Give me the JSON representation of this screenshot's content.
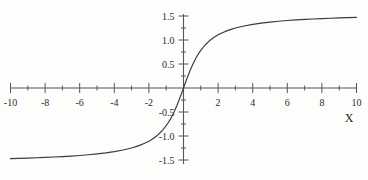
{
  "chart_data": {
    "type": "line",
    "title": "",
    "subtitle": "",
    "xlabel": "X",
    "ylabel": "",
    "function": "arctan(x)",
    "xlim": [
      -10,
      10
    ],
    "ylim": [
      -1.6,
      1.6
    ],
    "grid": false,
    "legend": false,
    "x_major_ticks": [
      -10,
      -8,
      -6,
      -4,
      -2,
      0,
      2,
      4,
      6,
      8,
      10
    ],
    "x_major_tick_labels": [
      "-10",
      "-8",
      "-6",
      "-4",
      "-2",
      "",
      "2",
      "4",
      "6",
      "8",
      "10"
    ],
    "x_minor_ticks": [
      -9,
      -7,
      -5,
      -3,
      -1,
      1,
      3,
      5,
      7,
      9
    ],
    "y_major_ticks": [
      -1.5,
      -1.0,
      -0.5,
      0.5,
      1.0,
      1.5
    ],
    "y_major_tick_labels": [
      "-1.5",
      "-1.0",
      "-0.5",
      "0.5",
      "1.0",
      "1.5"
    ],
    "y_minor_ticks": [
      -1.25,
      -0.75,
      -0.25,
      0.25,
      0.75,
      1.25
    ],
    "series": [
      {
        "name": "arctan(x)",
        "color": "#3a3a3a",
        "x": [
          -10,
          -9.5,
          -9,
          -8.5,
          -8,
          -7.5,
          -7,
          -6.5,
          -6,
          -5.5,
          -5,
          -4.5,
          -4,
          -3.5,
          -3,
          -2.75,
          -2.5,
          -2.25,
          -2,
          -1.75,
          -1.5,
          -1.25,
          -1,
          -0.875,
          -0.75,
          -0.625,
          -0.5,
          -0.375,
          -0.25,
          -0.125,
          0,
          0.125,
          0.25,
          0.375,
          0.5,
          0.625,
          0.75,
          0.875,
          1,
          1.25,
          1.5,
          1.75,
          2,
          2.25,
          2.5,
          2.75,
          3,
          3.5,
          4,
          4.5,
          5,
          5.5,
          6,
          6.5,
          7,
          7.5,
          8,
          8.5,
          9,
          9.5,
          10
        ],
        "y": [
          -1.471,
          -1.466,
          -1.46,
          -1.454,
          -1.446,
          -1.438,
          -1.429,
          -1.418,
          -1.406,
          -1.391,
          -1.373,
          -1.352,
          -1.326,
          -1.292,
          -1.249,
          -1.222,
          -1.19,
          -1.152,
          -1.107,
          -1.052,
          -0.983,
          -0.896,
          -0.785,
          -0.719,
          -0.644,
          -0.558,
          -0.464,
          -0.359,
          -0.245,
          -0.124,
          0,
          0.124,
          0.245,
          0.359,
          0.464,
          0.558,
          0.644,
          0.719,
          0.785,
          0.896,
          0.983,
          1.052,
          1.107,
          1.152,
          1.19,
          1.222,
          1.249,
          1.292,
          1.326,
          1.352,
          1.373,
          1.391,
          1.406,
          1.418,
          1.429,
          1.438,
          1.446,
          1.454,
          1.46,
          1.466,
          1.471
        ]
      }
    ],
    "asymptotes": [
      1.5708,
      -1.5708
    ],
    "axis_color": "#555555",
    "curve_color": "#3a3a3a"
  }
}
